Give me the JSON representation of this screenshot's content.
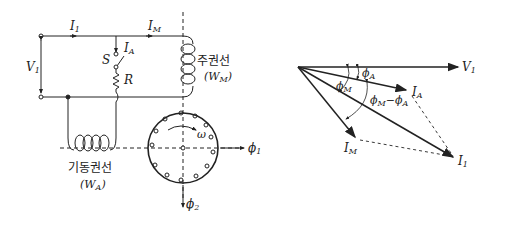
{
  "circuit": {
    "labels": {
      "I1": "I",
      "I1_sub": "1",
      "IM": "I",
      "IM_sub": "M",
      "IA": "I",
      "IA_sub": "A",
      "V1": "V",
      "V1_sub": "1",
      "S": "S",
      "R": "R",
      "omega": "ω",
      "phi1": "ϕ",
      "phi1_sub": "1",
      "phi2": "ϕ",
      "phi2_sub": "2"
    },
    "main_winding": {
      "name": "주권선",
      "symbol": "(W",
      "symbol_sub": "M",
      "close": ")"
    },
    "aux_winding": {
      "name": "기동권선",
      "symbol": "(W",
      "symbol_sub": "A",
      "close": ")"
    }
  },
  "phasor": {
    "V1": "V",
    "V1_sub": "1",
    "IA": "I",
    "IA_sub": "A",
    "IM": "I",
    "IM_sub": "M",
    "I1": "I",
    "I1_sub": "1",
    "phiA": "ϕ",
    "phiA_sub": "A",
    "phiM": "ϕ",
    "phiM_sub": "M",
    "diff_a": "ϕ",
    "diff_a_sub": "M",
    "diff_minus": "−",
    "diff_b": "ϕ",
    "diff_b_sub": "A"
  }
}
